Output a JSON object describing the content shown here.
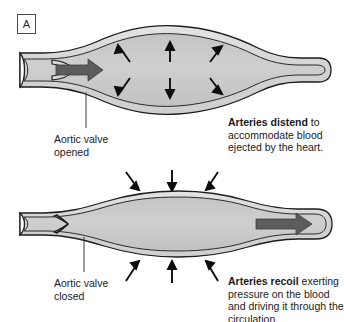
{
  "figure": {
    "panel_label": "A",
    "background_color": "#ffffff",
    "vessel_lumen_color": "#c9c9c9",
    "vessel_wall_color": "#d9d9d9",
    "outline_color": "#1a1a1a",
    "flow_arrow_color": "#595959",
    "pressure_arrow_color": "#111111"
  },
  "top_panel": {
    "name": "systole-artery-distends",
    "valve_label": "Aortic valve\nopened",
    "valve_state": "opened",
    "flow_arrow_direction": "right-into-vessel",
    "pressure_arrows": {
      "direction": "outward",
      "count": 6,
      "position": "inside-vessel"
    },
    "caption": {
      "lead": "Arteries distend",
      "rest": " to accommodate blood ejected by the heart.",
      "full": "Arteries distend to accommodate blood ejected by the heart."
    }
  },
  "bottom_panel": {
    "name": "diastole-artery-recoils",
    "valve_label": "Aortic valve\nclosed",
    "valve_state": "closed",
    "flow_arrow_direction": "right-out-of-vessel",
    "pressure_arrows": {
      "direction": "inward",
      "count": 6,
      "position": "outside-vessel"
    },
    "caption": {
      "lead": "Arteries recoil",
      "rest": " exerting pressure on the blood and driving it through the circulation.",
      "full": "Arteries recoil exerting pressure on the blood and driving it through the circulation."
    }
  }
}
